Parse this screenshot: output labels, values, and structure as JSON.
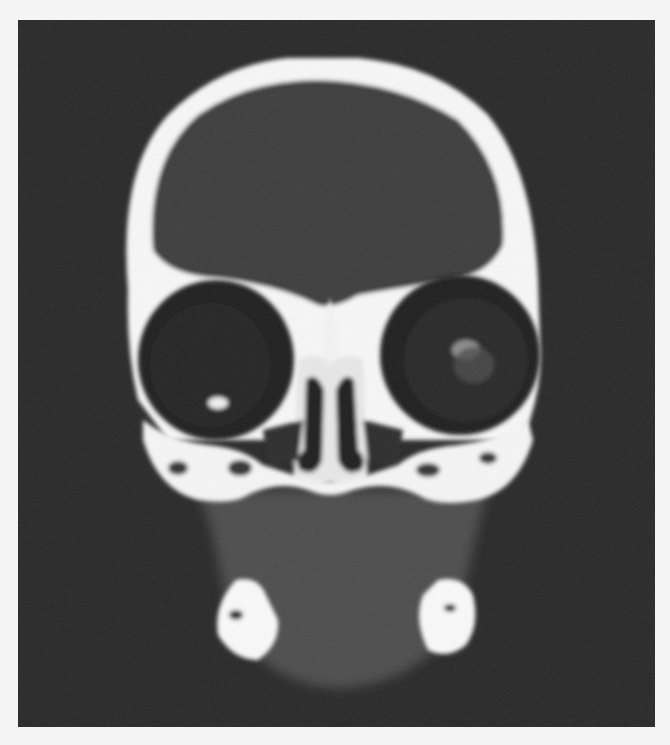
{
  "image": {
    "subject": "Coronal CT scan of skull",
    "modality": "CT",
    "plane": "coronal",
    "colors": {
      "page_background": "#f4f4f4",
      "scan_background": "#262626",
      "bone": "#fafafa",
      "soft_tissue": "#4a4a4a",
      "air": "#1e1e1e"
    }
  }
}
